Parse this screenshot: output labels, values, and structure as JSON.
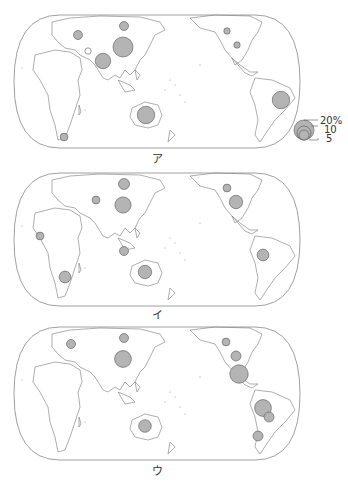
{
  "figure": {
    "bubble_color": "#b4b4b4",
    "outline_color": "#555555",
    "land_stroke": "#777777"
  },
  "legend": {
    "title": "",
    "entries": [
      {
        "label": "20%",
        "value": 20
      },
      {
        "label": "10",
        "value": 10
      },
      {
        "label": "5",
        "value": 5
      }
    ]
  },
  "panels": [
    {
      "label": "ア",
      "bubbles": [
        {
          "region": "Russia (Siberia)",
          "x": 124,
          "y": 26,
          "value": 4
        },
        {
          "region": "Europe (Poland)",
          "x": 78,
          "y": 35,
          "value": 4
        },
        {
          "region": "Central Asia (Kazakhstan)",
          "x": 88,
          "y": 51,
          "value": 2,
          "hollow": true
        },
        {
          "region": "China",
          "x": 123,
          "y": 47,
          "value": 20
        },
        {
          "region": "India",
          "x": 103,
          "y": 61,
          "value": 12
        },
        {
          "region": "Canada",
          "x": 227,
          "y": 31,
          "value": 2
        },
        {
          "region": "United States",
          "x": 237,
          "y": 45,
          "value": 2
        },
        {
          "region": "Brazil",
          "x": 281,
          "y": 100,
          "value": 15
        },
        {
          "region": "Australia",
          "x": 146,
          "y": 115,
          "value": 15
        },
        {
          "region": "South Africa",
          "x": 64,
          "y": 137,
          "value": 3
        }
      ]
    },
    {
      "label": "イ",
      "bubbles": [
        {
          "region": "Russia (Siberia)",
          "x": 124,
          "y": 184,
          "value": 6
        },
        {
          "region": "Kazakhstan",
          "x": 96,
          "y": 200,
          "value": 3
        },
        {
          "region": "China",
          "x": 123,
          "y": 205,
          "value": 13
        },
        {
          "region": "West Africa (Ghana)",
          "x": 40,
          "y": 236,
          "value": 3
        },
        {
          "region": "Indonesia",
          "x": 124,
          "y": 251,
          "value": 4
        },
        {
          "region": "Australia",
          "x": 145,
          "y": 272,
          "value": 9
        },
        {
          "region": "South Africa",
          "x": 65,
          "y": 277,
          "value": 7
        },
        {
          "region": "Canada",
          "x": 227,
          "y": 188,
          "value": 3
        },
        {
          "region": "United States",
          "x": 236,
          "y": 202,
          "value": 9
        },
        {
          "region": "Peru",
          "x": 263,
          "y": 255,
          "value": 7
        }
      ]
    },
    {
      "label": "ウ",
      "bubbles": [
        {
          "region": "Russia (Siberia)",
          "x": 124,
          "y": 338,
          "value": 4
        },
        {
          "region": "Europe (Poland)",
          "x": 71,
          "y": 344,
          "value": 4
        },
        {
          "region": "China",
          "x": 123,
          "y": 359,
          "value": 14
        },
        {
          "region": "Australia",
          "x": 145,
          "y": 426,
          "value": 8
        },
        {
          "region": "Canada",
          "x": 226,
          "y": 342,
          "value": 3
        },
        {
          "region": "United States",
          "x": 236,
          "y": 356,
          "value": 5
        },
        {
          "region": "Mexico",
          "x": 239,
          "y": 374,
          "value": 17
        },
        {
          "region": "Peru",
          "x": 263,
          "y": 408,
          "value": 14
        },
        {
          "region": "Bolivia",
          "x": 269,
          "y": 417,
          "value": 5
        },
        {
          "region": "Chile/Argentina",
          "x": 258,
          "y": 436,
          "value": 5
        }
      ]
    }
  ]
}
